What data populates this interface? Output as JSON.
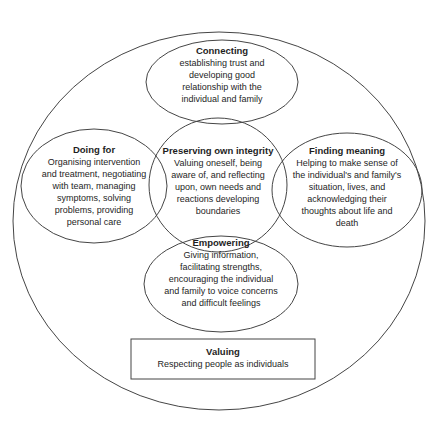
{
  "diagram": {
    "stroke_color": "#454545",
    "text_color": "#1e1e1e",
    "background_color": "#ffffff",
    "nodes": [
      {
        "id": "connecting",
        "title": "Connecting",
        "body": "establishing trust and\ndeveloping good\nrelationship with the\nindividual and family"
      },
      {
        "id": "doing-for",
        "title": "Doing for",
        "body": "Organising intervention\nand treatment, negotiating\nwith team, managing\nsymptoms, solving\nproblems, providing\npersonal care"
      },
      {
        "id": "preserving-own-integrity",
        "title": "Preserving own integrity",
        "body": "Valuing oneself, being\naware of, and reflecting\nupon, own needs and\nreactions developing\nboundaries"
      },
      {
        "id": "finding-meaning",
        "title": "Finding meaning",
        "body": "Helping to make sense of\nthe individual's and family's\nsituation, lives, and\nacknowledging their\nthoughts about life and\ndeath"
      },
      {
        "id": "empowering",
        "title": "Empowering",
        "body": "Giving information,\nfacilitating strengths,\nencouraging the individual\nand family to voice concerns\nand difficult feelings"
      },
      {
        "id": "valuing",
        "title": "Valuing",
        "body": "Respecting people as individuals"
      }
    ]
  }
}
